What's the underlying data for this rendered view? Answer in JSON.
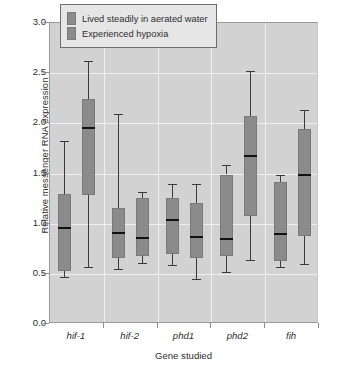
{
  "chart_data": {
    "type": "box",
    "title": "",
    "xlabel": "Gene studied",
    "ylabel": "Relative messenger RNA expression",
    "ylim": [
      0.0,
      3.0
    ],
    "yticks": [
      "0.0",
      "0.5",
      "1.0",
      "1.5",
      "2.0",
      "2.5",
      "3.0"
    ],
    "ytick_values": [
      0.0,
      0.5,
      1.0,
      1.5,
      2.0,
      2.5,
      3.0
    ],
    "grid": "horizontal-and-vertical",
    "legend_position": "top-center",
    "categories": [
      "hif-1",
      "hif-2",
      "phd1",
      "phd2",
      "fih"
    ],
    "series": [
      {
        "name": "Lived steadily in aerated water",
        "color": "#8b8b8b",
        "boxes": [
          {
            "category": "hif-1",
            "min": 0.47,
            "q1": 0.53,
            "median": 0.96,
            "q3": 1.3,
            "max": 1.82
          },
          {
            "category": "hif-2",
            "min": 0.55,
            "q1": 0.66,
            "median": 0.91,
            "q3": 1.16,
            "max": 2.09
          },
          {
            "category": "phd1",
            "min": 0.59,
            "q1": 0.7,
            "median": 1.04,
            "q3": 1.26,
            "max": 1.4
          },
          {
            "category": "phd2",
            "min": 0.52,
            "q1": 0.68,
            "median": 0.85,
            "q3": 1.49,
            "max": 1.58
          },
          {
            "category": "fih",
            "min": 0.57,
            "q1": 0.63,
            "median": 0.9,
            "q3": 1.42,
            "max": 1.49
          }
        ]
      },
      {
        "name": "Experienced hypoxia",
        "color": "#8b8b8b",
        "boxes": [
          {
            "category": "hif-1",
            "min": 0.57,
            "q1": 1.29,
            "median": 1.95,
            "q3": 2.24,
            "max": 2.62
          },
          {
            "category": "hif-2",
            "min": 0.61,
            "q1": 0.68,
            "median": 0.86,
            "q3": 1.26,
            "max": 1.32
          },
          {
            "category": "phd1",
            "min": 0.45,
            "q1": 0.66,
            "median": 0.87,
            "q3": 1.21,
            "max": 1.4
          },
          {
            "category": "phd2",
            "min": 0.64,
            "q1": 1.08,
            "median": 1.67,
            "q3": 2.07,
            "max": 2.52
          },
          {
            "category": "fih",
            "min": 0.6,
            "q1": 0.88,
            "median": 1.49,
            "q3": 1.94,
            "max": 2.13
          }
        ]
      }
    ]
  },
  "legend": {
    "items": [
      {
        "label": "Lived steadily in aerated water"
      },
      {
        "label": "Experienced hypoxia"
      }
    ]
  }
}
